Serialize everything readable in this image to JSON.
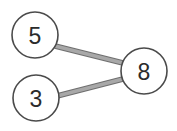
{
  "diagram": {
    "type": "node-link-graph",
    "title": "",
    "background_color": "#ffffff",
    "canvas": {
      "width": 177,
      "height": 131
    },
    "node_style": {
      "fill_color": "#ffffff",
      "stroke_color": "#4a4a4a",
      "stroke_width": 1.6,
      "label_color": "#2b2b2b",
      "label_font_size": 23,
      "radius": 23
    },
    "edge_style": {
      "stroke_color": "#a8a8a8",
      "outline_color": "#6f6f6f",
      "stroke_width": 4.5,
      "outline_width": 5.8
    },
    "nodes": [
      {
        "id": "n5",
        "label": "5",
        "cx": 35,
        "cy": 35,
        "r": 23
      },
      {
        "id": "n3",
        "label": "3",
        "cx": 36,
        "cy": 98,
        "r": 23
      },
      {
        "id": "n8",
        "label": "8",
        "cx": 144,
        "cy": 71,
        "r": 23
      }
    ],
    "edges": [
      {
        "id": "e5-8",
        "source": "n5",
        "target": "n8",
        "label": "",
        "x1": 55,
        "y1": 46,
        "x2": 123,
        "y2": 63
      },
      {
        "id": "e3-8",
        "source": "n3",
        "target": "n8",
        "label": "",
        "x1": 57,
        "y1": 96,
        "x2": 123,
        "y2": 79
      }
    ]
  }
}
